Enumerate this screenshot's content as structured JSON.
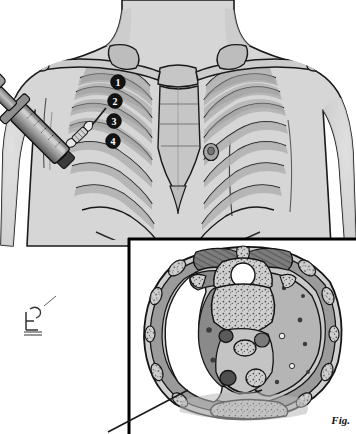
{
  "figure": {
    "caption": "Fig.",
    "signature": "artist-monogram"
  },
  "main_view": {
    "name": "anterior-chest-view",
    "description": "Anterior view of human torso showing rib cage, clavicles, sternum and needle insertion",
    "body_landmarks": [
      "clavicle-left",
      "clavicle-right",
      "scapula-left",
      "scapula-right",
      "sternum",
      "xiphoid-process",
      "rib-cage",
      "nipple-right"
    ],
    "intercostal_markers": [
      {
        "label": "1",
        "space": "first-intercostal-space",
        "cx": 118,
        "cy": 82
      },
      {
        "label": "2",
        "space": "second-intercostal-space",
        "cx": 115,
        "cy": 101
      },
      {
        "label": "3",
        "space": "third-intercostal-space",
        "cx": 114,
        "cy": 121
      },
      {
        "label": "4",
        "space": "fourth-intercostal-space",
        "cx": 113,
        "cy": 141
      }
    ],
    "instrument": {
      "name": "syringe-with-needle",
      "parts": [
        "plunger-knob",
        "plunger-shaft",
        "barrel",
        "finger-flange",
        "hub",
        "needle",
        "butterfly-wings"
      ],
      "entry_point": "intercostal-space",
      "angle_degrees": 45
    }
  },
  "inset_view": {
    "name": "axial-cross-section",
    "description": "Axial (transverse) CT-style section of the thorax showing pleural effusion",
    "border_color": "#000000",
    "structures": [
      {
        "name": "pleural-effusion",
        "side": "left",
        "shade": "white"
      },
      {
        "name": "collapsed-lung",
        "side": "left",
        "shade": "dark-gray"
      },
      {
        "name": "aerated-lung",
        "side": "right",
        "shade": "mid-gray"
      },
      {
        "name": "vertebral-body",
        "shade": "stippled-bone"
      },
      {
        "name": "spinal-canal",
        "shade": "white"
      },
      {
        "name": "spinous-process",
        "shade": "stippled-bone"
      },
      {
        "name": "paraspinal-muscles",
        "shade": "dark-gray"
      },
      {
        "name": "descending-aorta",
        "shade": "dark-gray"
      },
      {
        "name": "esophagus",
        "shade": "stippled"
      },
      {
        "name": "mediastinum",
        "shade": "light-gray"
      },
      {
        "name": "sternum",
        "shade": "stippled-bone"
      },
      {
        "name": "rib-cross-sections",
        "shade": "stippled-bone"
      },
      {
        "name": "chest-wall-musculature",
        "shade": "gray"
      },
      {
        "name": "pulmonary-vessels",
        "shade": "dark-specks"
      }
    ],
    "pointer": {
      "name": "effusion-leader-line",
      "target": "pleural-effusion",
      "from_x": 108,
      "from_y": 432,
      "to_x": 186,
      "to_y": 392
    }
  },
  "colors": {
    "skin": "#d6d6d6",
    "skin_shadow": "#c2c2c2",
    "bone": "#c9c9c9",
    "bone_shade": "#b0b0b0",
    "rib_fill": "#a9a9a9",
    "outline": "#111111",
    "lung_dark": "#8a8a8a",
    "lung_light": "#b5b5b5",
    "muscle_dark": "#6f6f6f",
    "muscle_mid": "#909090",
    "effusion": "#ffffff",
    "mediastinum": "#c4c4c4",
    "marker_fill": "#121212",
    "marker_text": "#ffffff",
    "syringe_body": "#9a9a9a",
    "syringe_dark": "#4a4a4a",
    "background": "#ffffff"
  }
}
